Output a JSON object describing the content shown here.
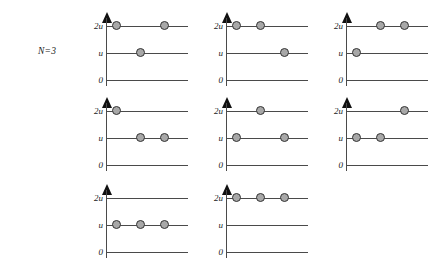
{
  "figure": {
    "name": "energy-level-occupation-diagrams",
    "particle_count_label": "N=3",
    "axis": {
      "tick_labels": [
        "2u",
        "u",
        "0"
      ],
      "levels": [
        "2u",
        "u",
        "0"
      ],
      "arrow": "up-arrow-icon"
    },
    "colors": {
      "background": "#ffffff",
      "line": "#4a4a4a",
      "arrow": "#111111",
      "particle_fill": "#a8a8a8",
      "particle_stroke": "#333333",
      "text": "#1a1a1a"
    },
    "slot_count": 3,
    "panels": [
      {
        "id": "panel-1",
        "row": 1,
        "col": 1,
        "occupancy": {
          "2u": [
            1,
            3
          ],
          "u": [
            2
          ],
          "0": []
        }
      },
      {
        "id": "panel-2",
        "row": 1,
        "col": 2,
        "occupancy": {
          "2u": [
            1,
            2
          ],
          "u": [
            3
          ],
          "0": []
        }
      },
      {
        "id": "panel-3",
        "row": 1,
        "col": 3,
        "occupancy": {
          "2u": [
            2,
            3
          ],
          "u": [
            1
          ],
          "0": []
        }
      },
      {
        "id": "panel-4",
        "row": 2,
        "col": 1,
        "occupancy": {
          "2u": [
            1
          ],
          "u": [
            2,
            3
          ],
          "0": []
        }
      },
      {
        "id": "panel-5",
        "row": 2,
        "col": 2,
        "occupancy": {
          "2u": [
            2
          ],
          "u": [
            1,
            3
          ],
          "0": []
        }
      },
      {
        "id": "panel-6",
        "row": 2,
        "col": 3,
        "occupancy": {
          "2u": [
            3
          ],
          "u": [
            1,
            2
          ],
          "0": []
        }
      },
      {
        "id": "panel-7",
        "row": 3,
        "col": 1,
        "occupancy": {
          "2u": [],
          "u": [
            1,
            2,
            3
          ],
          "0": []
        }
      },
      {
        "id": "panel-8",
        "row": 3,
        "col": 2,
        "occupancy": {
          "2u": [
            1,
            2,
            3
          ],
          "u": [],
          "0": []
        }
      }
    ]
  },
  "chart_data": {
    "type": "table",
    "title": "",
    "xlabel": "",
    "ylabel": "",
    "levels": [
      "2u",
      "u",
      "0"
    ],
    "slots": [
      1,
      2,
      3
    ],
    "series": [
      {
        "name": "panel-1",
        "values": [
          "2u",
          "u",
          "2u"
        ]
      },
      {
        "name": "panel-2",
        "values": [
          "2u",
          "2u",
          "u"
        ]
      },
      {
        "name": "panel-3",
        "values": [
          "u",
          "2u",
          "2u"
        ]
      },
      {
        "name": "panel-4",
        "values": [
          "2u",
          "u",
          "u"
        ]
      },
      {
        "name": "panel-5",
        "values": [
          "u",
          "2u",
          "u"
        ]
      },
      {
        "name": "panel-6",
        "values": [
          "u",
          "u",
          "2u"
        ]
      },
      {
        "name": "panel-7",
        "values": [
          "u",
          "u",
          "u"
        ]
      },
      {
        "name": "panel-8",
        "values": [
          "2u",
          "2u",
          "2u"
        ]
      }
    ]
  }
}
